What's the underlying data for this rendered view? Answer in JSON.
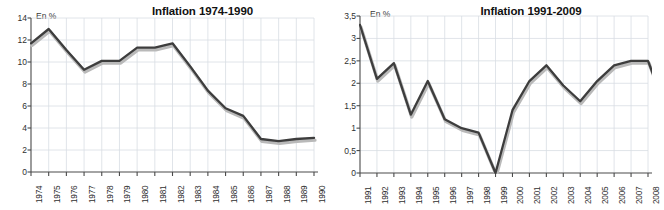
{
  "page": {
    "background": "#ffffff",
    "line_color": "#3d3d3d",
    "shadow_color": "#b9b9b9",
    "grid_color": "#d8dde3",
    "axis_color": "#4a4a4a"
  },
  "charts": [
    {
      "id": "inflation-1974-1990",
      "title": "Inflation 1974-1990",
      "unit_label": "En %",
      "type": "line",
      "xlabel": "",
      "ylabel": "En %",
      "grid": true,
      "legend": "none",
      "ylim": [
        0,
        14
      ],
      "ytick_values": [
        0,
        2,
        4,
        6,
        8,
        10,
        12,
        14
      ],
      "ytick_labels": [
        "0",
        "2",
        "4",
        "6",
        "8",
        "10",
        "12",
        "14"
      ],
      "categories": [
        "1974",
        "1975",
        "1976",
        "1977",
        "1978",
        "1979",
        "1980",
        "1981",
        "1982",
        "1983",
        "1984",
        "1985",
        "1686",
        "1987",
        "1988",
        "1989",
        "1990"
      ],
      "values": [
        11.7,
        13.0,
        11.1,
        9.3,
        10.1,
        10.1,
        11.3,
        11.3,
        11.7,
        9.6,
        7.4,
        5.8,
        5.1,
        3.0,
        2.8,
        3.0,
        3.1
      ]
    },
    {
      "id": "inflation-1991-2009",
      "title": "Inflation 1991-2009",
      "unit_label": "En %",
      "type": "line",
      "xlabel": "",
      "ylabel": "En %",
      "grid": true,
      "legend": "none",
      "ylim": [
        0,
        3.5
      ],
      "ytick_values": [
        0,
        0.5,
        1,
        1.5,
        2,
        2.5,
        3,
        3.5
      ],
      "ytick_labels": [
        "0",
        "0,5",
        "1",
        "1,5",
        "2",
        "2,5",
        "3",
        "3,5"
      ],
      "categories": [
        "1991",
        "1992",
        "1993",
        "1994",
        "1995",
        "1996",
        "1997",
        "1998",
        "1999",
        "2000",
        "2001",
        "2002",
        "2003",
        "2004",
        "2005",
        "2006",
        "2007",
        "2008",
        "2009"
      ],
      "values": [
        3.3,
        2.1,
        2.45,
        1.3,
        2.05,
        1.2,
        1.0,
        0.9,
        0.0,
        1.4,
        2.05,
        2.4,
        1.95,
        1.6,
        2.05,
        2.4,
        2.5,
        2.5,
        1.5
      ]
    }
  ],
  "chart_data": [
    {
      "type": "line",
      "title": "Inflation 1974-1990",
      "xlabel": "",
      "ylabel": "En %",
      "ylim": [
        0,
        14
      ],
      "grid": true,
      "legend": "none",
      "categories": [
        "1974",
        "1975",
        "1976",
        "1977",
        "1978",
        "1979",
        "1980",
        "1981",
        "1982",
        "1983",
        "1984",
        "1985",
        "1686",
        "1987",
        "1988",
        "1989",
        "1990"
      ],
      "values": [
        11.7,
        13.0,
        11.1,
        9.3,
        10.1,
        10.1,
        11.3,
        11.3,
        11.7,
        9.6,
        7.4,
        5.8,
        5.1,
        3.0,
        2.8,
        3.0,
        3.1
      ],
      "annotations": [
        "Axis label at index 12 reads '1686' (typo for 1986) in the source image"
      ]
    },
    {
      "type": "line",
      "title": "Inflation 1991-2009",
      "xlabel": "",
      "ylabel": "En %",
      "ylim": [
        0,
        3.5
      ],
      "grid": true,
      "legend": "none",
      "categories": [
        "1991",
        "1992",
        "1993",
        "1994",
        "1995",
        "1996",
        "1997",
        "1998",
        "1999",
        "2000",
        "2001",
        "2002",
        "2003",
        "2004",
        "2005",
        "2006",
        "2007",
        "2008",
        "2009"
      ],
      "values": [
        3.3,
        2.1,
        2.45,
        1.3,
        2.05,
        1.2,
        1.0,
        0.9,
        0.0,
        1.4,
        2.05,
        2.4,
        1.95,
        1.6,
        2.05,
        2.4,
        2.5,
        2.5,
        1.5
      ],
      "annotations": [
        "Final category 2009 is clipped by the right edge of the image; only tick labels through 2008 are visible"
      ]
    }
  ]
}
